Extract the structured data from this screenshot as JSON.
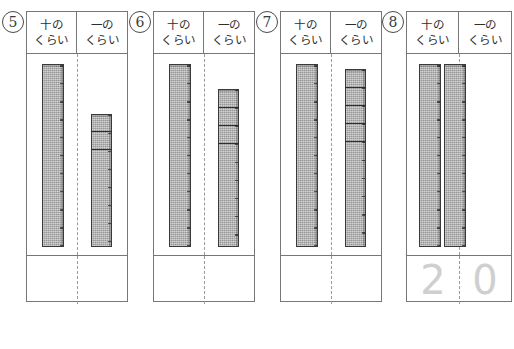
{
  "worksheet": {
    "headers": {
      "tens_line1": "十の",
      "tens_line2": "くらい",
      "ones_line1": "一の",
      "ones_line2": "くらい"
    },
    "colors": {
      "rod_fill": "#a9a9a9",
      "rod_stroke": "#3a3a3a",
      "table_border": "#777777",
      "trace_digit": "#cfcfcf"
    }
  },
  "problems": [
    {
      "number": "5",
      "tens_rods": 1,
      "ones_units": 3,
      "answer_tens": "",
      "answer_ones": "",
      "value": "13"
    },
    {
      "number": "6",
      "tens_rods": 1,
      "ones_units": 4,
      "answer_tens": "",
      "answer_ones": "",
      "value": "14"
    },
    {
      "number": "7",
      "tens_rods": 1,
      "ones_units": 5,
      "answer_tens": "",
      "answer_ones": "",
      "value": "15"
    },
    {
      "number": "8",
      "tens_rods": 2,
      "ones_units": 0,
      "answer_tens": "2",
      "answer_ones": "0",
      "value": "20"
    }
  ]
}
